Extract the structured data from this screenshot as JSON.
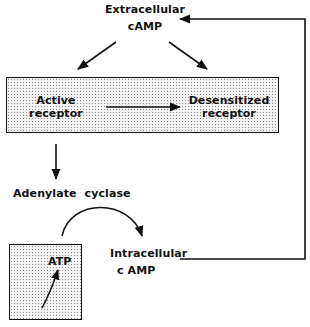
{
  "diagram": {
    "nodes": {
      "extracellular_camp": {
        "line1": "Extracellular",
        "line2": "cAMP"
      },
      "active_receptor": {
        "line1": "Active",
        "line2": "receptor"
      },
      "desensitized_receptor": {
        "line1": "Desensitized",
        "line2": "receptor"
      },
      "adenylate_cyclase": {
        "label": "Adenylate  cyclase"
      },
      "atp": {
        "label": "ATP"
      },
      "intracellular_camp": {
        "line1": "Intracellular",
        "line2": "c AMP"
      }
    },
    "edges": [
      {
        "from": "Extracellular cAMP",
        "to": "Active receptor",
        "type": "arrow"
      },
      {
        "from": "Extracellular cAMP",
        "to": "Desensitized receptor",
        "type": "arrow"
      },
      {
        "from": "Active receptor",
        "to": "Desensitized receptor",
        "type": "arrow"
      },
      {
        "from": "Active receptor",
        "to": "Adenylate cyclase",
        "type": "arrow"
      },
      {
        "from": "ATP",
        "to": "Intracellular cAMP",
        "type": "curved-arrow",
        "via": "Adenylate cyclase"
      },
      {
        "from": "Intracellular cAMP",
        "to": "Extracellular cAMP",
        "type": "feedback-elbow-arrow"
      }
    ],
    "colors": {
      "ink": "#111111",
      "box_fill": "#f4f4f4",
      "stipple": "#8a8a8a"
    }
  }
}
